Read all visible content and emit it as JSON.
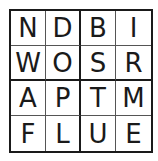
{
  "puzzle": {
    "rows": [
      [
        "N",
        "D",
        "B",
        "I"
      ],
      [
        "W",
        "O",
        "S",
        "R"
      ],
      [
        "A",
        "P",
        "T",
        "M"
      ],
      [
        "F",
        "L",
        "U",
        "E"
      ]
    ]
  }
}
